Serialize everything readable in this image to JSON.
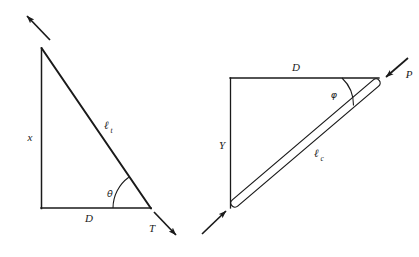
{
  "figure": {
    "background_color": "#ffffff",
    "line_color": "#1a1a1a",
    "panels": [
      {
        "name": "tension-triangle",
        "description": "Right triangle with tension member as hypotenuse",
        "labels": {
          "vertical_side": "x",
          "base_side": "D",
          "hypotenuse": "ℓ",
          "hypotenuse_subscript": "t",
          "angle": "θ",
          "force": "T"
        },
        "arrows": [
          {
            "name": "tension-arrow-upper-left",
            "direction": "up-left"
          },
          {
            "name": "tension-arrow-lower-right",
            "direction": "down-right"
          }
        ]
      },
      {
        "name": "compression-triangle",
        "description": "Right triangle with compression strut as hypotenuse",
        "labels": {
          "vertical_side": "Y",
          "top_side": "D",
          "strut": "ℓ",
          "strut_subscript": "c",
          "angle": "φ",
          "force": "P"
        },
        "arrows": [
          {
            "name": "compression-arrow-upper-right",
            "direction": "down-left"
          },
          {
            "name": "compression-arrow-lower-left",
            "direction": "up-right"
          }
        ]
      }
    ]
  }
}
